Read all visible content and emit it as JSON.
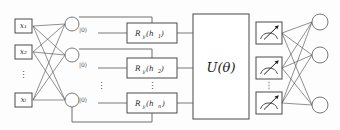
{
  "diagram": {
    "colors": {
      "wire": "#7a7a7a",
      "edge": "#555555",
      "box_stroke": "#4a4a4a",
      "node_stroke": "#6b6b6b",
      "text": "#1a1a1a",
      "background": "#fdfdfd"
    },
    "input_layer": {
      "name": "classical-input-layer",
      "nodes": [
        {
          "label": "x",
          "sub": "1",
          "text": "x₁"
        },
        {
          "label": "x",
          "sub": "2",
          "text": "x₂"
        },
        {
          "label": "x",
          "sub": "l",
          "text": "xₗ"
        }
      ],
      "ellipsis": "⋮"
    },
    "hidden_layer": {
      "name": "classical-hidden-layer",
      "node_count": 3,
      "labels": [
        "",
        "",
        ""
      ],
      "ellipsis": "⋮"
    },
    "qubit_states": {
      "name": "qubit-initial-states",
      "labels": [
        "|0⟩",
        "|0⟩",
        "|0⟩"
      ],
      "ellipsis": "⋮"
    },
    "rotation_gates": {
      "name": "ry-rotation-gates",
      "gates": [
        {
          "symbol": "R",
          "axis": "y",
          "arg": "h",
          "arg_sub": "1",
          "text": "R_y(h₁)"
        },
        {
          "symbol": "R",
          "axis": "y",
          "arg": "h",
          "arg_sub": "2",
          "text": "R_y(h₂)"
        },
        {
          "symbol": "R",
          "axis": "y",
          "arg": "h",
          "arg_sub": "n",
          "text": "R_y(hₙ)"
        }
      ],
      "ellipsis": "⋮"
    },
    "unitary": {
      "name": "variational-unitary",
      "label": "U(θ)",
      "symbol": "U",
      "param": "θ"
    },
    "measurements": {
      "name": "measurement-gates",
      "count": 3,
      "icon": "meter-gauge-icon",
      "ellipsis": "⋮"
    },
    "output_layer": {
      "name": "classical-output-layer",
      "node_count": 3,
      "labels": [
        "",
        "",
        ""
      ]
    }
  }
}
